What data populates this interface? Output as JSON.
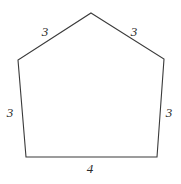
{
  "figure": {
    "kind": "geometry-diagram",
    "shape_name": "pentagon",
    "background_color": "#ffffff",
    "stroke_color": "#3a3a3a",
    "stroke_width": 1.1,
    "fill_color": "none",
    "label_color": "#2b2b2b",
    "canvas": {
      "width": 181,
      "height": 184
    },
    "vertices": [
      {
        "name": "apex",
        "x": 91,
        "y": 13
      },
      {
        "name": "right-upper",
        "x": 164,
        "y": 59
      },
      {
        "name": "right-lower",
        "x": 157,
        "y": 157
      },
      {
        "name": "left-lower",
        "x": 26,
        "y": 157
      },
      {
        "name": "left-upper",
        "x": 18,
        "y": 60
      }
    ],
    "polygon_points": "91,13 164,59 157,157 26,157 18,60",
    "labels": [
      {
        "name": "top-left-side",
        "text": "3",
        "x": 45,
        "y": 31
      },
      {
        "name": "top-right-side",
        "text": "3",
        "x": 134,
        "y": 31
      },
      {
        "name": "left-side",
        "text": "3",
        "x": 10,
        "y": 112
      },
      {
        "name": "right-side",
        "text": "3",
        "x": 169,
        "y": 112
      },
      {
        "name": "bottom-side",
        "text": "4",
        "x": 90,
        "y": 168
      }
    ]
  }
}
